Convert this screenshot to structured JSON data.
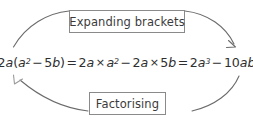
{
  "diagram": {
    "type": "cycle",
    "title_top": "Expanding brackets",
    "title_bottom": "Factorising",
    "equation_plain": "2a(a² − 5b) = 2a × a² − 2a × 5b = 2a³ − 10ab",
    "equation_parts": {
      "p1": "2",
      "p2": "a",
      "p3": "(",
      "p4": "a",
      "p5": "2",
      "p6": "−",
      "p7": "5",
      "p8": "b",
      "p9": ")",
      "p10": "=",
      "p11": "2",
      "p12": "a",
      "p13": "×",
      "p14": "a",
      "p15": "2",
      "p16": "−",
      "p17": "2",
      "p18": "a",
      "p19": "×",
      "p20": "5",
      "p21": "b",
      "p22": "=",
      "p23": "2",
      "p24": "a",
      "p25": "3",
      "p26": "−",
      "p27": "10",
      "p28": "ab"
    },
    "colors": {
      "background": "#ffffff",
      "box_border": "#8a8a8a",
      "box_fill": "#ffffff",
      "text": "#3b3b3b",
      "equation_text": "#2e2e2e",
      "arrow_stroke": "#6b6b6b"
    },
    "arrows": [
      {
        "name": "expanding-arrow",
        "direction": "left-to-right",
        "description": "curved arrow arcing over the top from left side to right side"
      },
      {
        "name": "factorising-arrow",
        "direction": "right-to-left",
        "description": "curved arrow arcing under the bottom from right side to left side"
      }
    ]
  }
}
